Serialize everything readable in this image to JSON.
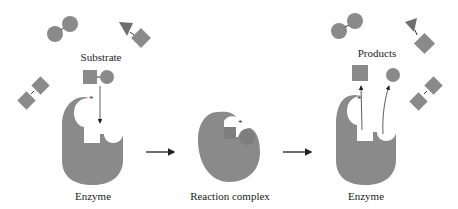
{
  "figure": {
    "colors": {
      "shape_fill": "#8a8a8a",
      "triangle_fill": "#6e6e6e",
      "line": "#222222",
      "background": "#ffffff"
    },
    "panels": [
      {
        "name": "enzyme-with-substrate",
        "labels": {
          "top": "Substrate",
          "bottom": "Enzyme"
        },
        "marker": "*"
      },
      {
        "name": "reaction-complex",
        "labels": {
          "bottom": "Reaction complex"
        },
        "marker": "*"
      },
      {
        "name": "enzyme-with-products",
        "labels": {
          "top": "Products",
          "bottom": "Enzyme"
        },
        "marker": "*"
      }
    ],
    "arrows": [
      "arrow-1-to-2",
      "arrow-2-to-3"
    ]
  }
}
